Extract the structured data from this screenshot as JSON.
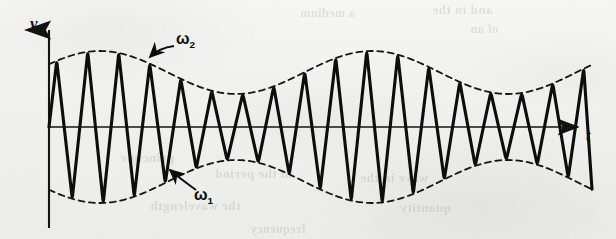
{
  "figure": {
    "kind": "beats-waveform",
    "caption": "",
    "background_color": "#f2f2f0",
    "ink_color": "#111111"
  },
  "axes": {
    "y_label": "v",
    "x_label": "t",
    "y_axis_x": 49,
    "x_axis_y": 127,
    "y_axis_top": 25,
    "y_axis_bottom": 228,
    "x_axis_left": 49,
    "x_axis_right": 592,
    "arrowheads": [
      "y-axis-up",
      "x-axis-right"
    ]
  },
  "annotations": [
    {
      "name": "omega-2",
      "label": "ω",
      "subscript": "2",
      "x": 176,
      "y": 36,
      "leader": "curved arrow pointing down-left to upper envelope"
    },
    {
      "name": "omega-1",
      "label": "ω",
      "subscript": "1",
      "x": 194,
      "y": 190,
      "leader": "straight arrow pointing up-left to lower envelope"
    }
  ],
  "ghost_text": [
    {
      "text": "and in the",
      "x": 432,
      "y": 2,
      "size": 13
    },
    {
      "text": "a medium",
      "x": 300,
      "y": 6,
      "size": 12
    },
    {
      "text": "of an",
      "x": 470,
      "y": 22,
      "size": 12
    },
    {
      "text": "principle",
      "x": 120,
      "y": 150,
      "size": 13
    },
    {
      "text": "in the period",
      "x": 215,
      "y": 166,
      "size": 13
    },
    {
      "text": "wave in the",
      "x": 360,
      "y": 170,
      "size": 13
    },
    {
      "text": "the wavelength",
      "x": 150,
      "y": 198,
      "size": 13
    },
    {
      "text": "quantity",
      "x": 400,
      "y": 200,
      "size": 13
    },
    {
      "text": "frequency",
      "x": 250,
      "y": 222,
      "size": 12
    }
  ],
  "chart_data": {
    "type": "line",
    "title": "",
    "xlabel": "t",
    "ylabel": "v",
    "grid": false,
    "legend": "none",
    "xlim": [
      0,
      1
    ],
    "ylim": [
      -1.15,
      1.15
    ],
    "carrier": {
      "name": "resultant-wave",
      "style": "solid",
      "line_width": 3,
      "color": "#111111",
      "cycles_visible": 17.5,
      "period_px": 31,
      "start_phase_deg": 0,
      "peak_amplitude_px": 76
    },
    "envelope_upper": {
      "name": "upper-envelope",
      "style": "dashed",
      "line_width": 1.6,
      "color": "#1a1a1a",
      "cycles_visible": 2.0,
      "max_amplitude_px": 76,
      "min_amplitude_px": 33,
      "peaks_x_px": [
        100,
        372
      ],
      "troughs_x_px": [
        236,
        508
      ]
    },
    "envelope_lower": {
      "name": "lower-envelope",
      "style": "dashed",
      "line_width": 1.6,
      "color": "#1a1a1a",
      "mirror_of": "upper-envelope"
    },
    "series": [
      {
        "name": "upper envelope amplitude (px from axis)",
        "x": [
          49,
          77,
          104,
          131,
          158,
          185,
          213,
          240,
          267,
          294,
          321,
          349,
          376,
          403,
          430,
          457,
          485,
          512,
          539,
          566,
          592
        ],
        "values": [
          66,
          75,
          76,
          70,
          58,
          45,
          36,
          33,
          38,
          48,
          60,
          71,
          76,
          75,
          67,
          55,
          42,
          34,
          33,
          40,
          52
        ]
      },
      {
        "name": "lower envelope amplitude (px from axis)",
        "x": [
          49,
          77,
          104,
          131,
          158,
          185,
          213,
          240,
          267,
          294,
          321,
          349,
          376,
          403,
          430,
          457,
          485,
          512,
          539,
          566,
          592
        ],
        "values": [
          -66,
          -75,
          -76,
          -70,
          -58,
          -45,
          -36,
          -33,
          -38,
          -48,
          -60,
          -71,
          -76,
          -75,
          -67,
          -55,
          -42,
          -34,
          -33,
          -40,
          -52
        ]
      }
    ]
  }
}
